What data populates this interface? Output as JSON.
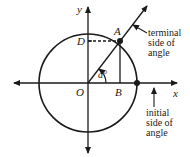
{
  "diagram": {
    "type": "unit-circle-angle",
    "colors": {
      "stroke": "#1a1a1a",
      "background": "#ffffff"
    },
    "axes": {
      "x_label": "x",
      "y_label": "y"
    },
    "points": {
      "origin": "O",
      "A": "A",
      "B": "B",
      "D": "D"
    },
    "angle_label": "a°",
    "annotations": {
      "terminal": [
        "terminal",
        "side of",
        "angle"
      ],
      "initial": [
        "initial",
        "side of",
        "angle"
      ]
    }
  }
}
